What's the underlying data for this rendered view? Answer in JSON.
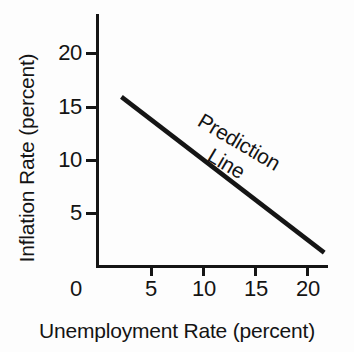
{
  "chart_data": {
    "type": "line",
    "title": "",
    "subtitle": "",
    "xlabel": "Unemployment Rate (percent)",
    "ylabel": "Inflation Rate (percent)",
    "xlim": [
      0,
      22
    ],
    "ylim": [
      0,
      23.5
    ],
    "xticks": [
      0,
      5,
      10,
      15,
      20
    ],
    "xticklabels": [
      "0",
      "5",
      "10",
      "15",
      "20"
    ],
    "yticks": [
      5,
      10,
      15,
      20
    ],
    "yticklabels": [
      "5",
      "10",
      "15",
      "20"
    ],
    "grid": false,
    "legend": "none",
    "series": [
      {
        "name": "Prediction Line",
        "x": [
          2.3,
          21.8
        ],
        "y": [
          15.9,
          1.3
        ],
        "color": "#151515",
        "linewidth": 4.5
      }
    ],
    "annotations": [
      {
        "name": "prediction-line-label",
        "line1": "Prediction",
        "line2": "Line",
        "rotation_deg": 30.5,
        "x": 11.5,
        "y": 12.5
      }
    ]
  },
  "axes": {
    "y_title": "Inflation Rate (percent)",
    "x_title": "Unemployment Rate (percent)",
    "y_tick_labels": [
      "20",
      "15",
      "10",
      "5"
    ],
    "x_tick_labels": [
      "0",
      "5",
      "10",
      "15",
      "20"
    ]
  },
  "annotation": {
    "line1": "Prediction",
    "line2": "Line"
  },
  "colors": {
    "ink": "#151515",
    "background": "#fdfdfd",
    "series": "#151515"
  }
}
